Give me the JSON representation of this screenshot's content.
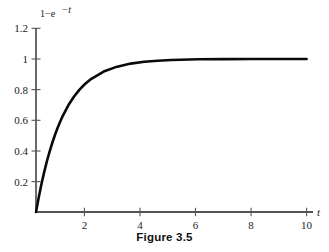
{
  "figure": {
    "caption": "Figure 3.5"
  },
  "chart_data": {
    "type": "line",
    "title": "",
    "subtitle": "",
    "xlabel": "t",
    "ylabel": "1−e⁻ᵗ",
    "ylabel_parts": {
      "base": "1−e",
      "exponent": "−t"
    },
    "xlim": [
      0,
      10.5
    ],
    "ylim": [
      0,
      1.2
    ],
    "grid": false,
    "legend": null,
    "legend_position": "none",
    "xticks": [
      2,
      4,
      6,
      8,
      10
    ],
    "xtick_labels": [
      "2",
      "4",
      "6",
      "8",
      "10"
    ],
    "yticks": [
      0.2,
      0.4,
      0.6,
      0.8,
      1,
      1.2
    ],
    "ytick_labels": [
      "0.2",
      "0.4",
      "0.6",
      "0.8",
      "1",
      "1.2"
    ],
    "series": [
      {
        "name": "1-e^{-t}",
        "color": "#0a0a0a",
        "x": [
          0,
          0.1,
          0.2,
          0.3,
          0.4,
          0.5,
          0.6,
          0.7,
          0.8,
          0.9,
          1,
          1.2,
          1.4,
          1.6,
          1.8,
          2,
          2.5,
          3,
          3.5,
          4,
          4.5,
          5,
          6,
          7,
          8,
          9,
          10
        ],
        "y": [
          0,
          0.095,
          0.181,
          0.259,
          0.33,
          0.393,
          0.451,
          0.503,
          0.551,
          0.593,
          0.632,
          0.699,
          0.753,
          0.798,
          0.835,
          0.865,
          0.918,
          0.95,
          0.97,
          0.982,
          0.989,
          0.993,
          0.998,
          0.999,
          1,
          1,
          1
        ]
      }
    ]
  }
}
